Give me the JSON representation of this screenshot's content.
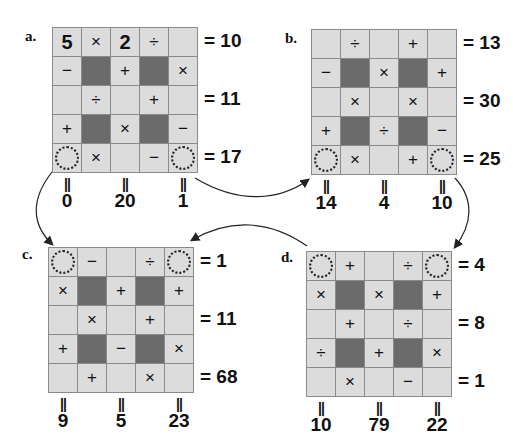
{
  "puzzles": [
    {
      "label": "a.",
      "cells": [
        [
          "5",
          "×",
          "2",
          "÷",
          ""
        ],
        [
          "−",
          "#",
          "+",
          "#",
          "×"
        ],
        [
          "",
          "÷",
          "",
          "+",
          ""
        ],
        [
          "+",
          "#",
          "×",
          "#",
          "−"
        ],
        [
          "O",
          "×",
          "",
          "−",
          "O"
        ]
      ],
      "row_results": [
        "= 10",
        "= 11",
        "= 17"
      ],
      "col_results": [
        "0",
        "20",
        "1"
      ]
    },
    {
      "label": "b.",
      "cells": [
        [
          "",
          "÷",
          "",
          "+",
          ""
        ],
        [
          "−",
          "#",
          "×",
          "#",
          "+"
        ],
        [
          "",
          "×",
          "",
          "×",
          ""
        ],
        [
          "+",
          "#",
          "÷",
          "#",
          "−"
        ],
        [
          "O",
          "×",
          "",
          "+",
          "O"
        ]
      ],
      "row_results": [
        "= 13",
        "= 30",
        "= 25"
      ],
      "col_results": [
        "14",
        "4",
        "10"
      ]
    },
    {
      "label": "c.",
      "cells": [
        [
          "O",
          "−",
          "",
          "÷",
          "O"
        ],
        [
          "×",
          "#",
          "+",
          "#",
          "+"
        ],
        [
          "",
          "×",
          "",
          "+",
          ""
        ],
        [
          "+",
          "#",
          "−",
          "#",
          "×"
        ],
        [
          "",
          "+",
          "",
          "×",
          ""
        ]
      ],
      "row_results": [
        "= 1",
        "= 11",
        "= 68"
      ],
      "col_results": [
        "9",
        "5",
        "23"
      ]
    },
    {
      "label": "d.",
      "cells": [
        [
          "O",
          "+",
          "",
          "÷",
          "O"
        ],
        [
          "×",
          "#",
          "×",
          "#",
          "+"
        ],
        [
          "",
          "+",
          "",
          "÷",
          ""
        ],
        [
          "÷",
          "#",
          "+",
          "#",
          "×"
        ],
        [
          "",
          "×",
          "",
          "−",
          ""
        ]
      ],
      "row_results": [
        "= 4",
        "= 8",
        "= 1"
      ],
      "col_results": [
        "10",
        "79",
        "22"
      ]
    }
  ],
  "col_eq_symbol": "=",
  "colors": {
    "cell": "#dcdcdc",
    "dark": "#6b6b6b",
    "grid_line": "#8a8a8a"
  }
}
